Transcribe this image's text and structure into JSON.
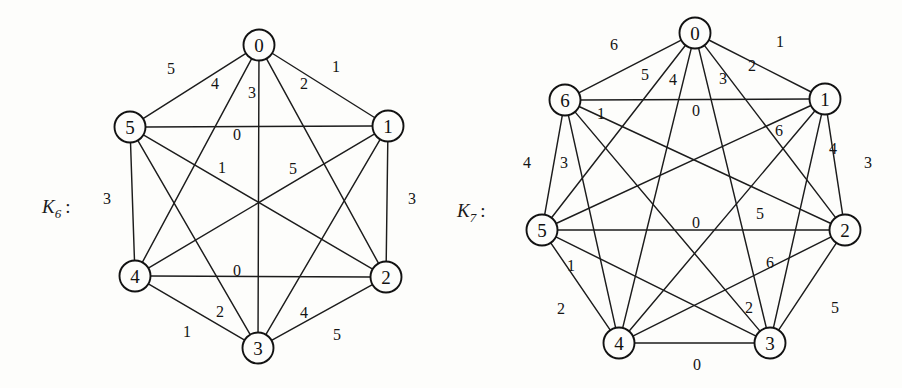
{
  "figure": {
    "caption_k6": "K",
    "caption_k6_sub": "6",
    "caption_k6_colon": ":",
    "caption_k7": "K",
    "caption_k7_sub": "7",
    "caption_k7_colon": ":",
    "line_color": "#1c1c1c",
    "node_fill": "#fdfdfb",
    "background": "#fdfdfb"
  },
  "chart_data": {
    "type": "diagram",
    "graphs": [
      {
        "name": "K6",
        "label": "K₆ :",
        "label_pos": [
          42,
          196
        ],
        "node_radius": 15.5,
        "nodes": [
          {
            "id": "0",
            "x": 259,
            "y": 45
          },
          {
            "id": "1",
            "x": 388,
            "y": 126
          },
          {
            "id": "2",
            "x": 386,
            "y": 277
          },
          {
            "id": "3",
            "x": 258,
            "y": 348
          },
          {
            "id": "4",
            "x": 135,
            "y": 276
          },
          {
            "id": "5",
            "x": 130,
            "y": 127
          }
        ],
        "edges": [
          {
            "u": "0",
            "v": "5",
            "label": "5",
            "lx": 171,
            "ly": 68
          },
          {
            "u": "0",
            "v": "4",
            "label": "4",
            "lx": 215,
            "ly": 83
          },
          {
            "u": "0",
            "v": "3",
            "label": "3",
            "lx": 252,
            "ly": 92
          },
          {
            "u": "0",
            "v": "2",
            "label": "2",
            "lx": 304,
            "ly": 83
          },
          {
            "u": "0",
            "v": "1",
            "label": "1",
            "lx": 336,
            "ly": 66
          },
          {
            "u": "5",
            "v": "1",
            "label": "0",
            "lx": 237,
            "ly": 134
          },
          {
            "u": "5",
            "v": "2",
            "label": "1",
            "lx": 222,
            "ly": 167
          },
          {
            "u": "4",
            "v": "1",
            "label": "5",
            "lx": 293,
            "ly": 168
          },
          {
            "u": "5",
            "v": "4",
            "label": "3",
            "lx": 107,
            "ly": 198
          },
          {
            "u": "1",
            "v": "2",
            "label": "3",
            "lx": 412,
            "ly": 198
          },
          {
            "u": "4",
            "v": "2",
            "label": "0",
            "lx": 237,
            "ly": 270
          },
          {
            "u": "5",
            "v": "3",
            "label": "2",
            "lx": 220,
            "ly": 311
          },
          {
            "u": "4",
            "v": "3",
            "label": "1",
            "lx": 187,
            "ly": 331
          },
          {
            "u": "1",
            "v": "3",
            "label": "4",
            "lx": 304,
            "ly": 312
          },
          {
            "u": "2",
            "v": "3",
            "label": "5",
            "lx": 337,
            "ly": 334
          }
        ]
      },
      {
        "name": "K7",
        "label": "K₇ :",
        "label_pos": [
          457,
          200
        ],
        "node_radius": 15.5,
        "nodes": [
          {
            "id": "0",
            "x": 695,
            "y": 33
          },
          {
            "id": "1",
            "x": 825,
            "y": 99
          },
          {
            "id": "2",
            "x": 845,
            "y": 230
          },
          {
            "id": "3",
            "x": 770,
            "y": 343
          },
          {
            "id": "4",
            "x": 619,
            "y": 343
          },
          {
            "id": "5",
            "x": 542,
            "y": 230
          },
          {
            "id": "6",
            "x": 565,
            "y": 100
          }
        ],
        "edges": [
          {
            "u": "0",
            "v": "6",
            "label": "6",
            "lx": 614,
            "ly": 44
          },
          {
            "u": "0",
            "v": "5",
            "label": "5",
            "lx": 645,
            "ly": 74
          },
          {
            "u": "0",
            "v": "4",
            "label": "4",
            "lx": 673,
            "ly": 79
          },
          {
            "u": "0",
            "v": "3",
            "label": "3",
            "lx": 723,
            "ly": 78
          },
          {
            "u": "0",
            "v": "2",
            "label": "2",
            "lx": 752,
            "ly": 65
          },
          {
            "u": "0",
            "v": "1",
            "label": "1",
            "lx": 780,
            "ly": 41
          },
          {
            "u": "6",
            "v": "1",
            "label": "0",
            "lx": 696,
            "ly": 110
          },
          {
            "u": "6",
            "v": "2",
            "label": "1",
            "lx": 601,
            "ly": 113
          },
          {
            "u": "1",
            "v": "5",
            "label": "6",
            "lx": 779,
            "ly": 130
          },
          {
            "u": "6",
            "v": "5",
            "label": "4",
            "lx": 527,
            "ly": 162
          },
          {
            "u": "6",
            "v": "4",
            "label": "3",
            "lx": 564,
            "ly": 162
          },
          {
            "u": "1",
            "v": "2",
            "label": "3",
            "lx": 868,
            "ly": 162
          },
          {
            "u": "1",
            "v": "3",
            "label": "4",
            "lx": 833,
            "ly": 148
          },
          {
            "u": "1",
            "v": "4",
            "label": "5",
            "lx": 760,
            "ly": 213
          },
          {
            "u": "5",
            "v": "2",
            "label": "0",
            "lx": 696,
            "ly": 222
          },
          {
            "u": "5",
            "v": "3",
            "label": "1",
            "lx": 571,
            "ly": 265
          },
          {
            "u": "2",
            "v": "4",
            "label": "6",
            "lx": 770,
            "ly": 262
          },
          {
            "u": "5",
            "v": "4",
            "label": "2",
            "lx": 561,
            "ly": 308
          },
          {
            "u": "6",
            "v": "3",
            "label": "2",
            "lx": 749,
            "ly": 307
          },
          {
            "u": "2",
            "v": "3",
            "label": "5",
            "lx": 835,
            "ly": 307
          },
          {
            "u": "4",
            "v": "3",
            "label": "0",
            "lx": 697,
            "ly": 364
          }
        ]
      }
    ]
  }
}
